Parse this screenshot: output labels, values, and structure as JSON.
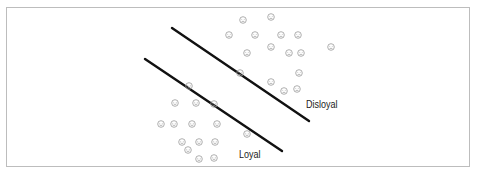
{
  "diagram": {
    "type": "classification-boundaries",
    "labels": {
      "disloyal": "Disloyal",
      "loyal": "Loyal"
    },
    "colors": {
      "line": "#111111",
      "face": "#9a9a9a",
      "frame": "#bdbdbd"
    },
    "lines": [
      {
        "name": "upper-boundary",
        "x1": 172,
        "y1": 28,
        "x2": 309,
        "y2": 121
      },
      {
        "name": "lower-boundary",
        "x1": 145,
        "y1": 59,
        "x2": 282,
        "y2": 151
      }
    ],
    "groups": {
      "disloyal": {
        "icon": "face-icon",
        "points": [
          [
            243,
            20
          ],
          [
            271,
            17
          ],
          [
            229,
            35
          ],
          [
            255,
            35
          ],
          [
            281,
            35
          ],
          [
            298,
            35
          ],
          [
            271,
            47
          ],
          [
            289,
            53
          ],
          [
            301,
            53
          ],
          [
            331,
            47
          ],
          [
            247,
            53
          ],
          [
            240,
            73
          ],
          [
            299,
            73
          ],
          [
            271,
            82
          ],
          [
            284,
            91
          ],
          [
            297,
            89
          ]
        ]
      },
      "loyal": {
        "icon": "face-icon",
        "points": [
          [
            189,
            86
          ],
          [
            175,
            103
          ],
          [
            196,
            103
          ],
          [
            214,
            104
          ],
          [
            161,
            124
          ],
          [
            174,
            124
          ],
          [
            192,
            124
          ],
          [
            217,
            124
          ],
          [
            247,
            134
          ],
          [
            182,
            142
          ],
          [
            199,
            142
          ],
          [
            215,
            142
          ],
          [
            188,
            150
          ],
          [
            199,
            159
          ],
          [
            214,
            158
          ]
        ]
      }
    }
  }
}
